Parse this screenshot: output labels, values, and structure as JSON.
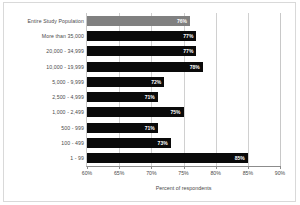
{
  "chart_data": {
    "type": "bar",
    "orientation": "horizontal",
    "title": "",
    "xlabel": "Percent of respondents",
    "ylabel": "",
    "xlim": [
      60,
      90
    ],
    "xticks": [
      60,
      65,
      70,
      75,
      80,
      85,
      90
    ],
    "xtick_labels": [
      "60%",
      "65%",
      "70%",
      "75%",
      "80%",
      "85%",
      "90%"
    ],
    "grid": true,
    "legend": "none",
    "categories": [
      "Entire Study Population",
      "More than 35,000",
      "20,000 - 34,999",
      "10,000 - 19,999",
      "5,000 - 9,999",
      "2,500 - 4,999",
      "1,000 - 2,499",
      "500 - 999",
      "100 - 499",
      "1 - 99"
    ],
    "values": [
      76,
      77,
      77,
      78,
      72,
      71,
      75,
      71,
      73,
      85
    ],
    "data_labels": [
      "76%",
      "77%",
      "77%",
      "78%",
      "72%",
      "71%",
      "75%",
      "71%",
      "73%",
      "85%"
    ],
    "bar_colors": [
      "#808080",
      "#0a0a0a",
      "#0a0a0a",
      "#0a0a0a",
      "#0a0a0a",
      "#0a0a0a",
      "#0a0a0a",
      "#0a0a0a",
      "#0a0a0a",
      "#0a0a0a"
    ],
    "highlight_index": 0
  },
  "colors": {
    "bar": "#0a0a0a",
    "highlight_bar": "#808080",
    "gridline": "#d0d0d0",
    "axis": "#8c8c8c",
    "frame": "#d9d9d9",
    "text": "#4a4a4a",
    "data_label_text": "#ffffff"
  }
}
